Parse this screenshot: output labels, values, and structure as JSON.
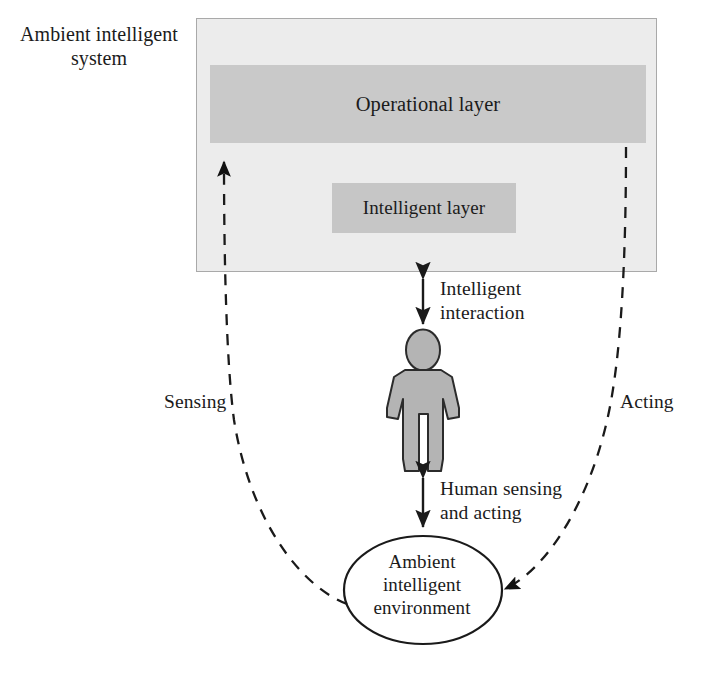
{
  "figure": {
    "type": "block-flow-diagram",
    "background_color": "#ffffff",
    "text_color": "#1b1b1b"
  },
  "system": {
    "title": "Ambient intelligent\nsystem",
    "container_fill": "#ececec",
    "container_stroke": "#a8a8a8",
    "layers": [
      {
        "id": "operational-layer",
        "label": "Operational layer",
        "fill": "#c9c9c9"
      },
      {
        "id": "intelligent-layer",
        "label": "Intelligent layer",
        "fill": "#c6c6c6"
      }
    ]
  },
  "actor": {
    "name": "human-figure",
    "fill": "#b4b4b4",
    "stroke": "#2a2a2a"
  },
  "environment": {
    "label": "Ambient\nintelligent\nenvironment",
    "shape": "ellipse",
    "fill": "#ffffff",
    "stroke": "#1a1a1a"
  },
  "connectors": [
    {
      "id": "intelligent-interaction",
      "label": "Intelligent\ninteraction",
      "style": "solid",
      "arrows": "double",
      "from": "ambient-intelligent-system",
      "to": "human-figure"
    },
    {
      "id": "human-sensing-and-acting",
      "label": "Human sensing\nand acting",
      "style": "solid",
      "arrows": "double",
      "from": "human-figure",
      "to": "ambient-intelligent-environment"
    },
    {
      "id": "sensing",
      "label": "Sensing",
      "style": "dashed",
      "arrows": "single",
      "from": "ambient-intelligent-environment",
      "to": "ambient-intelligent-system"
    },
    {
      "id": "acting",
      "label": "Acting",
      "style": "dashed",
      "arrows": "single",
      "from": "ambient-intelligent-system",
      "to": "ambient-intelligent-environment"
    }
  ]
}
